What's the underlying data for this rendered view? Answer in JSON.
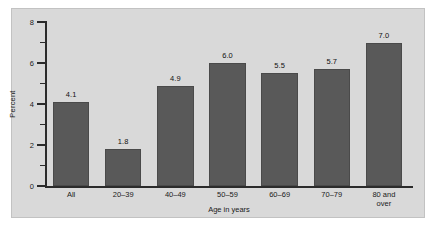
{
  "chart_data": {
    "type": "bar",
    "title": "",
    "subtitle": "",
    "xlabel": "Age in years",
    "ylabel": "Percent",
    "categories": [
      "All",
      "20–39",
      "40–49",
      "50–59",
      "60–69",
      "70–79",
      "80 and\nover"
    ],
    "values": [
      4.1,
      1.8,
      4.9,
      6.0,
      5.5,
      5.7,
      7.0
    ],
    "value_labels": [
      "4.1",
      "1.8",
      "4.9",
      "6.0",
      "5.5",
      "5.7",
      "7.0"
    ],
    "ylim": [
      0,
      8
    ],
    "ytick_labels": [
      "0",
      "2",
      "4",
      "6",
      "8"
    ],
    "ytick_values": [
      0,
      2,
      4,
      6,
      8
    ],
    "yminor_ticks": [
      1,
      3,
      5,
      7
    ],
    "grid": false,
    "legend": false,
    "legend_position": "none",
    "bar_color": "#595959",
    "panel_color": "#d9d9d9",
    "axis_color": "#2b2b2b",
    "text_color": "#1a1a1a"
  }
}
